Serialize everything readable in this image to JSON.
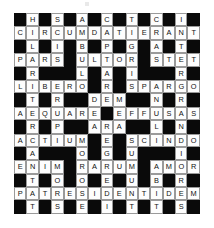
{
  "puzzle": {
    "title": "",
    "type": "crossword-grid",
    "rows": 15,
    "columns": 15,
    "colors": {
      "block": "#0a0a0a",
      "light": "#fdfdfd",
      "grid_line": "#9a9a9a",
      "letter": "#111111",
      "background": "#ffffff"
    },
    "grid": [
      [
        "",
        "H",
        "",
        "S",
        "",
        "A",
        "",
        "C",
        "",
        "T",
        "",
        "C",
        "",
        "I",
        ""
      ],
      [
        "C",
        "I",
        "R",
        "C",
        "U",
        "M",
        "D",
        "A",
        "T",
        "I",
        "E",
        "R",
        "A",
        "N",
        "T"
      ],
      [
        "",
        "L",
        "",
        "I",
        "",
        "B",
        "",
        "P",
        "",
        "G",
        "",
        "A",
        "",
        "T",
        ""
      ],
      [
        "P",
        "A",
        "R",
        "S",
        "",
        "U",
        "L",
        "T",
        "O",
        "R",
        "",
        "S",
        "T",
        "E",
        "T"
      ],
      [
        "",
        "R",
        "",
        "",
        "",
        "L",
        "",
        "A",
        "",
        "I",
        "",
        "",
        "",
        "R",
        ""
      ],
      [
        "L",
        "I",
        "B",
        "E",
        "R",
        "O",
        "",
        "R",
        "",
        "S",
        "P",
        "A",
        "R",
        "G",
        "O"
      ],
      [
        "",
        "T",
        "",
        "R",
        "",
        "",
        "D",
        "E",
        "M",
        "",
        "",
        "N",
        "",
        "R",
        ""
      ],
      [
        "A",
        "E",
        "Q",
        "U",
        "A",
        "R",
        "E",
        "",
        "E",
        "F",
        "F",
        "U",
        "S",
        "A",
        "S"
      ],
      [
        "",
        "R",
        "",
        "P",
        "",
        "",
        "A",
        "R",
        "A",
        "",
        "",
        "L",
        "",
        "N",
        ""
      ],
      [
        "A",
        "C",
        "T",
        "I",
        "U",
        "M",
        "",
        "E",
        "",
        "S",
        "C",
        "I",
        "N",
        "D",
        "O"
      ],
      [
        "",
        "A",
        "",
        "",
        "",
        "O",
        "",
        "G",
        "",
        "U",
        "",
        "",
        "",
        "I",
        ""
      ],
      [
        "E",
        "N",
        "I",
        "M",
        "",
        "R",
        "A",
        "R",
        "U",
        "M",
        "",
        "A",
        "M",
        "O",
        "R"
      ],
      [
        "",
        "T",
        "",
        "O",
        "",
        "O",
        "",
        "E",
        "",
        "U",
        "",
        "B",
        "",
        "R",
        ""
      ],
      [
        "P",
        "A",
        "T",
        "R",
        "E",
        "S",
        "I",
        "D",
        "E",
        "N",
        "T",
        "I",
        "D",
        "E",
        "M"
      ],
      [
        "",
        "T",
        "",
        "S",
        "",
        "E",
        "",
        "I",
        "",
        "T",
        "",
        "T",
        "",
        "S",
        ""
      ]
    ]
  }
}
